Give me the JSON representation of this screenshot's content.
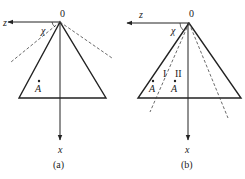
{
  "figure": {
    "panels": [
      {
        "id": "a",
        "caption": "(a)",
        "origin_label": "0",
        "z_axis_label": "z",
        "x_axis_label": "x",
        "angle_label": "χ",
        "points": [
          {
            "label": "A"
          }
        ]
      },
      {
        "id": "b",
        "caption": "(b)",
        "origin_label": "0",
        "z_axis_label": "z",
        "x_axis_label": "x",
        "angle_label": "χ",
        "region_labels": [
          "I",
          "II"
        ],
        "points": [
          {
            "label": "A"
          },
          {
            "label": "A"
          }
        ]
      }
    ]
  },
  "colors": {
    "stroke": "#222222",
    "dashed": "#444444",
    "background": "#ffffff"
  }
}
